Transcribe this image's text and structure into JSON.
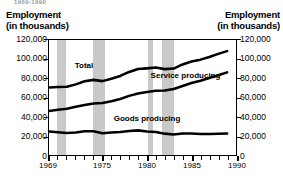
{
  "figure": {
    "cut_title": "1969-1990",
    "left_axis_title_line1": "Employment",
    "left_axis_title_line2": "(in thousands)",
    "right_axis_title_line1": "Employment",
    "right_axis_title_line2": "(in thousands)"
  },
  "chart_data": {
    "type": "line",
    "title": "Employment (in thousands)",
    "xlabel": "",
    "ylabel": "Employment (in thousands)",
    "ylim": [
      0,
      120000
    ],
    "xlim": [
      1969,
      1990
    ],
    "grid": false,
    "legend": "inline-annotations",
    "ytick_labels": [
      "0",
      "20,000",
      "40,000",
      "60,000",
      "80,000",
      "100,000",
      "120,000"
    ],
    "ytick_values": [
      0,
      20000,
      40000,
      60000,
      80000,
      100000,
      120000
    ],
    "xtick_labels": [
      "1969",
      "1975",
      "1980",
      "1985",
      "1990"
    ],
    "xtick_values": [
      1969,
      1975,
      1980,
      1985,
      1990
    ],
    "x": [
      1969,
      1970,
      1971,
      1972,
      1973,
      1974,
      1975,
      1976,
      1977,
      1978,
      1979,
      1980,
      1981,
      1982,
      1983,
      1984,
      1985,
      1986,
      1987,
      1988,
      1989
    ],
    "series": [
      {
        "name": "Total",
        "label": "Total",
        "values": [
          70400,
          70900,
          71200,
          73700,
          76900,
          78400,
          77100,
          79500,
          82500,
          86700,
          89800,
          90400,
          91200,
          89600,
          90200,
          94500,
          97500,
          99500,
          102200,
          105500,
          108400
        ]
      },
      {
        "name": "Service producing",
        "label": "Service producing",
        "values": [
          45800,
          47300,
          48300,
          50300,
          52100,
          53700,
          54300,
          56000,
          58500,
          61700,
          64100,
          65800,
          67100,
          67300,
          68900,
          72000,
          75200,
          77500,
          80300,
          83300,
          86200
        ]
      },
      {
        "name": "Goods producing",
        "label": "Goods producing",
        "values": [
          24600,
          23800,
          22900,
          23400,
          24800,
          24700,
          22600,
          23400,
          24000,
          25100,
          25700,
          24500,
          24100,
          22300,
          21300,
          22500,
          22400,
          22000,
          22000,
          22200,
          22400
        ]
      }
    ],
    "shaded_regions": [
      {
        "label": "recession",
        "start": 1969.9,
        "end": 1970.9
      },
      {
        "label": "recession",
        "start": 1973.9,
        "end": 1975.2
      },
      {
        "label": "recession",
        "start": 1980.0,
        "end": 1980.6
      },
      {
        "label": "recession",
        "start": 1981.5,
        "end": 1982.9
      }
    ],
    "shade_color": "#c9c9c9",
    "line_color": "#000000"
  }
}
